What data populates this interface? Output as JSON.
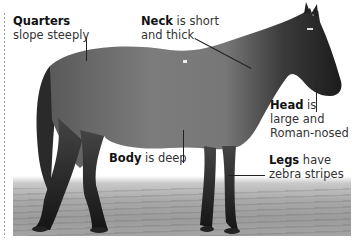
{
  "figure": {
    "colors": {
      "background": "#ffffff",
      "text": "#333333",
      "label_bold": "#111111",
      "leader_line": "#222222",
      "horse_body": "#6f6f6f",
      "horse_dark": "#1e1e1e",
      "ground": "#a6a6a6",
      "dotted_border": "#9a9a9a"
    }
  },
  "labels": {
    "quarters": {
      "term": "Quarters",
      "rest_line1": "",
      "line2": "slope steeply"
    },
    "neck": {
      "term": "Neck",
      "rest_line1": " is short",
      "line2": "and thick"
    },
    "head": {
      "term": "Head",
      "rest_line1": " is",
      "line2": "large and",
      "line3": "Roman-nosed"
    },
    "body": {
      "term": "Body",
      "rest_line1": " is deep"
    },
    "legs": {
      "term": "Legs",
      "rest_line1": " have",
      "line2": "zebra stripes"
    }
  }
}
